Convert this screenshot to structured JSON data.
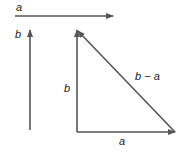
{
  "labels": {
    "top_a": "a",
    "left_b": "b",
    "tri_b": "b",
    "tri_diag": "b − a",
    "tri_a": "a"
  },
  "colors": {
    "arrow": "#555555",
    "text": "#222222"
  }
}
